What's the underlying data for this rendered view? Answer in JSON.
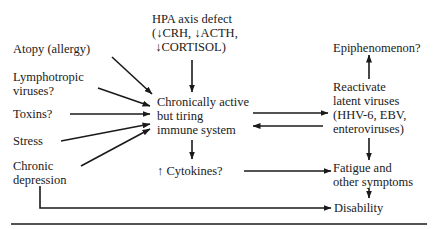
{
  "diagram": {
    "nodes": {
      "hpa": {
        "lines": [
          "HPA axis defect",
          "(↓CRH, ↓ACTH,",
          " ↓CORTISOL)"
        ]
      },
      "atopy": {
        "label": "Atopy (allergy)"
      },
      "lymphotropic": {
        "lines": [
          "Lymphotropic",
          "viruses?"
        ]
      },
      "toxins": {
        "label": "Toxins?"
      },
      "stress": {
        "label": "Stress"
      },
      "depression": {
        "lines": [
          "Chronic",
          "depression"
        ]
      },
      "immune": {
        "lines": [
          "Chronically active",
          "but tiring",
          "immune system"
        ]
      },
      "cytokines": {
        "label": "↑ Cytokines?"
      },
      "epiphenomenon": {
        "label": "Epiphenomenon?"
      },
      "reactivate": {
        "lines": [
          "Reactivate",
          "latent viruses",
          "(HHV-6, EBV,",
          "enteroviruses)"
        ]
      },
      "fatigue": {
        "lines": [
          "Fatigue and",
          "other symptoms"
        ]
      },
      "disability": {
        "label": "Disability"
      }
    },
    "edges": [
      {
        "from": "hpa",
        "to": "immune"
      },
      {
        "from": "atopy",
        "to": "immune"
      },
      {
        "from": "lymphotropic",
        "to": "immune"
      },
      {
        "from": "toxins",
        "to": "immune"
      },
      {
        "from": "stress",
        "to": "immune"
      },
      {
        "from": "depression",
        "to": "immune"
      },
      {
        "from": "immune",
        "to": "reactivate"
      },
      {
        "from": "reactivate",
        "to": "immune"
      },
      {
        "from": "immune",
        "to": "cytokines"
      },
      {
        "from": "reactivate",
        "to": "epiphenomenon"
      },
      {
        "from": "reactivate",
        "to": "fatigue"
      },
      {
        "from": "cytokines",
        "to": "fatigue"
      },
      {
        "from": "fatigue",
        "to": "disability"
      },
      {
        "from": "depression",
        "to": "disability"
      }
    ],
    "colors": {
      "ink": "#1a1a1a",
      "background": "#ffffff"
    }
  }
}
